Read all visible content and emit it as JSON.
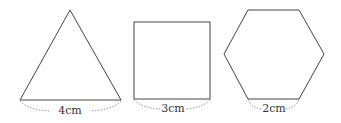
{
  "shapes": [
    {
      "name": "equilateral-triangle",
      "side_label": "4cm"
    },
    {
      "name": "square",
      "side_label": "3cm"
    },
    {
      "name": "regular-hexagon",
      "side_label": "2cm"
    }
  ],
  "colors": {
    "stroke": "#444444",
    "dotted": "#777777",
    "label": "#333333"
  }
}
